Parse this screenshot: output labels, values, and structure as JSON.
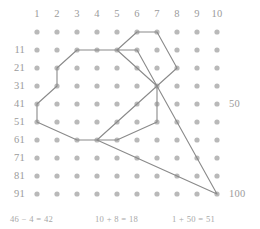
{
  "grid": {
    "columns": 10,
    "rows": 10,
    "origin_x": 37,
    "origin_y": 32,
    "step_x": 20,
    "step_y": 18,
    "dot_color": "#b9b9b9",
    "dot_radius": 2.6
  },
  "column_headers": [
    "1",
    "2",
    "3",
    "4",
    "5",
    "6",
    "7",
    "8",
    "9",
    "10"
  ],
  "row_headers": [
    "",
    "11",
    "21",
    "31",
    "41",
    "51",
    "61",
    "71",
    "81",
    "91"
  ],
  "side_labels": [
    {
      "text": "50",
      "row": 5,
      "name": "side-label-50"
    },
    {
      "text": "100",
      "row": 10,
      "name": "side-label-100"
    }
  ],
  "line_color": "#8a8a8a",
  "line_width": 1.1,
  "shapes": [
    {
      "name": "octagon-path",
      "closed": true,
      "points": [
        [
          3,
          2
        ],
        [
          5,
          2
        ],
        [
          7,
          4
        ],
        [
          7,
          6
        ],
        [
          5,
          7
        ],
        [
          3,
          7
        ],
        [
          1,
          6
        ],
        [
          1,
          5
        ],
        [
          2,
          4
        ],
        [
          2,
          3
        ]
      ]
    },
    {
      "name": "heptagon-path",
      "closed": true,
      "points": [
        [
          6,
          1
        ],
        [
          7,
          1
        ],
        [
          8,
          3
        ],
        [
          7,
          4
        ],
        [
          6,
          2
        ],
        [
          5,
          2
        ]
      ]
    },
    {
      "name": "triangle-path",
      "closed": true,
      "points": [
        [
          7,
          4
        ],
        [
          10,
          10
        ],
        [
          4,
          7
        ]
      ]
    }
  ],
  "equations": [
    {
      "text": "46 − 4 = 42",
      "name": "equation-1",
      "left": 10
    },
    {
      "text": "10 + 8 = 18",
      "name": "equation-2",
      "left": 95
    },
    {
      "text": "1 + 50 = 51",
      "name": "equation-3",
      "left": 172
    }
  ]
}
